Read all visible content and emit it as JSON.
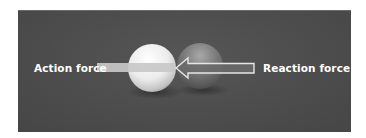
{
  "figure": {
    "labels": {
      "action": "Action force",
      "reaction": "Reaction force"
    },
    "colors": {
      "background_panel": "#4f4f4f",
      "page_background": "#ffffff",
      "label_text": "#ffffff",
      "action_arrow_fill": "#c8c8c8",
      "reaction_arrow_outline": "#e6e6e6",
      "reaction_arrow_fill": "#6a6a6a",
      "white_ball": "#e8e8e8",
      "dark_ball": "#7a7a7a"
    },
    "objects": [
      {
        "name": "white-ball",
        "label": "white ball"
      },
      {
        "name": "dark-ball",
        "label": "dark ball"
      }
    ],
    "arrows": [
      {
        "name": "action-force-arrow",
        "direction": "right",
        "style": "solid bar"
      },
      {
        "name": "reaction-force-arrow",
        "direction": "left",
        "style": "outlined arrow"
      }
    ]
  }
}
